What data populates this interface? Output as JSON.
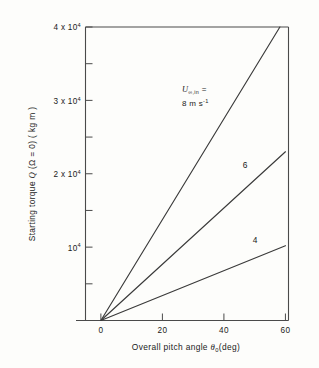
{
  "chart_data": {
    "type": "line",
    "title": "",
    "xlabel": "Overall pitch angle θ0 (deg)",
    "xlabel_main": "Overall pitch angle",
    "xlabel_symbol": "θ",
    "xlabel_sub": "0",
    "xlabel_units": "(deg)",
    "ylabel": "Starting torque Q (Ω = 0) (kg m)",
    "ylabel_pre": "Starting torque",
    "ylabel_symbol": "Q",
    "ylabel_cond": "(Ω = 0)",
    "ylabel_units": "(kg m)",
    "xlim": [
      -5,
      61
    ],
    "ylim": [
      0,
      40000
    ],
    "grid": false,
    "legend_position": "inline-annotations",
    "x_ticks": [
      0,
      20,
      40,
      60
    ],
    "x_tick_labels": [
      "0",
      "20",
      "40",
      "60"
    ],
    "y_ticks": [
      0,
      5000,
      10000,
      15000,
      20000,
      25000,
      30000,
      35000,
      40000
    ],
    "y_tick_labels": [
      "",
      "",
      "10⁴",
      "",
      "2 x 10⁴",
      "",
      "3 x 10⁴",
      "",
      "4 x 10⁴"
    ],
    "y_labeled_ticks": [
      {
        "value": 10000,
        "mantissa": "10",
        "exponent": "4",
        "has_mantissa_prefix": false,
        "prefix": ""
      },
      {
        "value": 20000,
        "mantissa": "10",
        "exponent": "4",
        "has_mantissa_prefix": true,
        "prefix": "2 x "
      },
      {
        "value": 30000,
        "mantissa": "10",
        "exponent": "4",
        "has_mantissa_prefix": true,
        "prefix": "3 x "
      },
      {
        "value": 40000,
        "mantissa": "10",
        "exponent": "4",
        "has_mantissa_prefix": true,
        "prefix": "4 x "
      }
    ],
    "series": [
      {
        "name": "8 m s⁻¹",
        "wind_speed": 8,
        "x": [
          0,
          58.2
        ],
        "values": [
          0,
          40000
        ],
        "label": "8",
        "label_position": "annotation"
      },
      {
        "name": "6 m s⁻¹",
        "wind_speed": 6,
        "x": [
          0,
          60
        ],
        "values": [
          0,
          23000
        ],
        "label": "6",
        "label_position": "inline-right"
      },
      {
        "name": "4 m s⁻¹",
        "wind_speed": 4,
        "x": [
          0,
          60
        ],
        "values": [
          0,
          10200
        ],
        "label": "4",
        "label_position": "inline-right"
      }
    ],
    "annotations": [
      {
        "name": "wind-speed-annotation",
        "symbol": "U",
        "subscript": "∞,in",
        "equals": "=",
        "value_line": "8 m s",
        "value_exponent": "-1",
        "full_text": "U∞,in = 8 m s⁻¹"
      },
      {
        "name": "curve-label-6",
        "text": "6"
      },
      {
        "name": "curve-label-4",
        "text": "4"
      }
    ]
  }
}
